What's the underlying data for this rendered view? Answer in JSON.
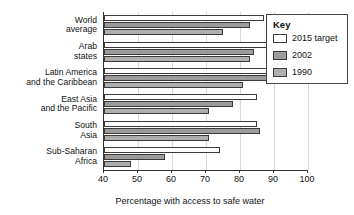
{
  "chart_data": {
    "type": "bar",
    "orientation": "horizontal",
    "title": "",
    "xlabel": "Percentage with access to safe water",
    "ylabel": "",
    "xlim": [
      40,
      100
    ],
    "xticks": [
      40,
      50,
      60,
      70,
      80,
      90,
      100
    ],
    "grid": true,
    "legend_position": "top-right",
    "legend_title": "Key",
    "categories": [
      "World average",
      "Arab states",
      "Latin America and the Caribbean",
      "East Asia and the Pacific",
      "South Asia",
      "Sub-Saharan Africa"
    ],
    "category_lines": [
      [
        "World",
        "average"
      ],
      [
        "Arab",
        "states"
      ],
      [
        "Latin America",
        "and the Caribbean"
      ],
      [
        "East Asia",
        "and the Pacific"
      ],
      [
        "South",
        "Asia"
      ],
      [
        "Sub-Saharan",
        "Africa"
      ]
    ],
    "series": [
      {
        "name": "2015 target",
        "color": "#ffffff",
        "values": [
          87,
          91,
          90,
          85,
          85,
          74
        ]
      },
      {
        "name": "2002",
        "color": "#9b9b9b",
        "values": [
          83,
          84,
          89,
          78,
          86,
          58
        ]
      },
      {
        "name": "1990",
        "color": "#aeaeae",
        "values": [
          75,
          83,
          81,
          71,
          71,
          48
        ]
      }
    ]
  },
  "legend": {
    "title": "Key",
    "entries": [
      {
        "label": "2015 target",
        "swatch": "s-target"
      },
      {
        "label": "2002",
        "swatch": "s-2002"
      },
      {
        "label": "1990",
        "swatch": "s-1990"
      }
    ]
  }
}
